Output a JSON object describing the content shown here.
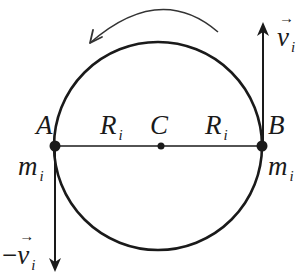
{
  "figure": {
    "type": "physics-diagram",
    "colors": {
      "stroke": "#1a1a1a",
      "background": "#ffffff"
    },
    "circle": {
      "cx": 158,
      "cy": 146,
      "r": 104
    },
    "rotation_direction": "counterclockwise",
    "points": {
      "A": {
        "label": "A",
        "mass_label": "m",
        "mass_sub": "i"
      },
      "B": {
        "label": "B",
        "mass_label": "m",
        "mass_sub": "i"
      },
      "C": {
        "label": "C"
      }
    },
    "radius_labels": [
      {
        "main": "R",
        "sub": "i"
      },
      {
        "main": "R",
        "sub": "i"
      }
    ],
    "velocities": {
      "up": {
        "prefix": "",
        "main": "v",
        "sub": "i",
        "direction": "up",
        "at": "B"
      },
      "down": {
        "prefix": "−",
        "main": "v",
        "sub": "i",
        "direction": "down",
        "at": "A"
      }
    }
  }
}
